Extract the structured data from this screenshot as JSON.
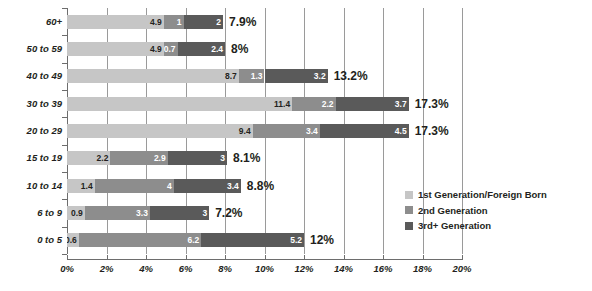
{
  "chart_data": {
    "type": "bar",
    "orientation": "horizontal",
    "stacked": true,
    "title": "",
    "xlabel": "",
    "ylabel": "",
    "xlim": [
      0,
      20
    ],
    "xticks": [
      "0%",
      "2%",
      "4%",
      "6%",
      "8%",
      "10%",
      "12%",
      "14%",
      "16%",
      "18%",
      "20%"
    ],
    "xtick_values": [
      0,
      2,
      4,
      6,
      8,
      10,
      12,
      14,
      16,
      18,
      20
    ],
    "grid": "vertical",
    "legend_position": "bottom-right",
    "categories": [
      "60+",
      "50 to 59",
      "40 to 49",
      "30 to 39",
      "20 to 29",
      "15 to 19",
      "10 to 14",
      "6 to 9",
      "0 to 5"
    ],
    "series": [
      {
        "name": "1st Generation/Foreign Born",
        "color": "#c6c6c6",
        "values": [
          4.9,
          4.9,
          8.7,
          11.4,
          9.4,
          2.2,
          1.4,
          0.9,
          0.6
        ],
        "labels": [
          "4.9",
          "4.9",
          "8.7",
          "11.4",
          "9.4",
          "2.2",
          "1.4",
          "0.9",
          "0.6"
        ]
      },
      {
        "name": "2nd Generation",
        "color": "#8d8d8d",
        "values": [
          1,
          0.7,
          1.3,
          2.2,
          3.4,
          2.9,
          4,
          3.3,
          6.2
        ],
        "labels": [
          "1",
          "0.7",
          "1.3",
          "2.2",
          "3.4",
          "2.9",
          "4",
          "3.3",
          "6.2"
        ]
      },
      {
        "name": "3rd+ Generation",
        "color": "#5a5a5a",
        "values": [
          2,
          2.4,
          3.2,
          3.7,
          4.5,
          3,
          3.4,
          3,
          5.2
        ],
        "labels": [
          "2",
          "2.4",
          "3.2",
          "3.7",
          "4.5",
          "3",
          "3.4",
          "3",
          "5.2"
        ]
      }
    ],
    "totals": [
      7.9,
      8,
      13.2,
      17.3,
      17.3,
      8.1,
      8.8,
      7.2,
      12
    ],
    "total_labels": [
      "7.9%",
      "8%",
      "13.2%",
      "17.3%",
      "17.3%",
      "8.1%",
      "8.8%",
      "7.2%",
      "12%"
    ]
  },
  "legend": {
    "items": [
      {
        "label": "1st Generation/Foreign Born",
        "color": "#c6c6c6"
      },
      {
        "label": "2nd Generation",
        "color": "#8d8d8d"
      },
      {
        "label": "3rd+ Generation",
        "color": "#5a5a5a"
      }
    ]
  },
  "colors": {
    "series1": "#c6c6c6",
    "series2": "#8d8d8d",
    "series3": "#5a5a5a",
    "gridline": "#9a9a9a",
    "axis": "#6d6d6d",
    "text": "#231f20",
    "background": "#ffffff"
  }
}
